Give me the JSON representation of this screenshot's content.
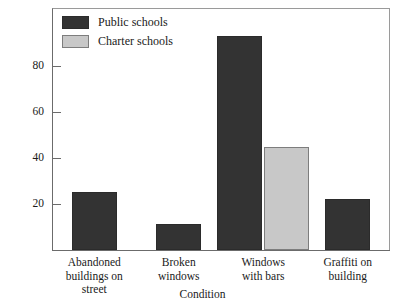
{
  "chart_data": {
    "type": "bar",
    "title": "",
    "xlabel": "Condition",
    "ylabel": "",
    "categories": [
      "Abandoned buildings on street",
      "Broken windows",
      "Windows with bars",
      "Graffiti on building"
    ],
    "category_lines": [
      [
        "Abandoned",
        "buildings on",
        "street"
      ],
      [
        "Broken",
        "windows"
      ],
      [
        "Windows",
        "with bars"
      ],
      [
        "Graffiti on",
        "building"
      ]
    ],
    "series": [
      {
        "name": "Public schools",
        "color": "#333333",
        "values": [
          25,
          11.5,
          93,
          22
        ]
      },
      {
        "name": "Charter schools",
        "color": "#c8c8c8",
        "values": [
          null,
          null,
          44.5,
          null
        ]
      }
    ],
    "ylim": [
      0,
      105
    ],
    "yticks": [
      20,
      40,
      60,
      80
    ],
    "ytick_labels": [
      "20",
      "40",
      "60",
      "80"
    ],
    "grid": false,
    "legend_position": "top-left"
  },
  "legend": {
    "items": [
      {
        "label": "Public schools",
        "swatch": "dark-swatch"
      },
      {
        "label": "Charter schools",
        "swatch": "light-swatch"
      }
    ]
  }
}
